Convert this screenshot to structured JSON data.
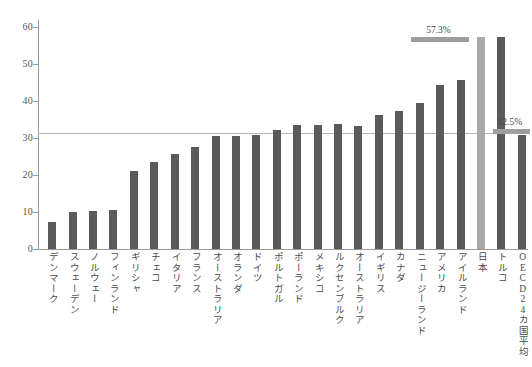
{
  "chart_data": {
    "type": "bar",
    "title": "",
    "xlabel": "",
    "ylabel": "",
    "ylim": [
      0,
      62
    ],
    "grid": false,
    "legend": "none",
    "y_ticks": [
      0,
      10,
      20,
      30,
      40,
      50,
      60
    ],
    "categories": [
      "デンマーク",
      "スウェーデン",
      "ノルウェー",
      "フィンランド",
      "ギリシャ",
      "チェコ",
      "イタリア",
      "フランス",
      "オーストラリア",
      "オランダ",
      "ドイツ",
      "ポルトガル",
      "ポーランド",
      "メキシコ",
      "ルクセンブルク",
      "オーストラリア",
      "イギリス",
      "カナダ",
      "ニュージーランド",
      "アメリカ",
      "アイルランド",
      "日本",
      "トルコ",
      "OECD24カ国平均"
    ],
    "values": [
      7.4,
      10.1,
      10.2,
      10.6,
      21.2,
      23.5,
      25.8,
      27.5,
      30.5,
      30.5,
      31.0,
      32.2,
      33.7,
      33.6,
      33.8,
      33.4,
      36.2,
      37.4,
      39.4,
      44.3,
      45.7,
      57.3,
      57.5,
      31.0
    ],
    "highlight_index": 21,
    "highlight_label": "日本",
    "reference_line_value": 31.4,
    "annotations": [
      {
        "label": "57.3%",
        "value": 57.3
      },
      {
        "label": "32.5%",
        "value": 32.5
      }
    ],
    "colors": {
      "bar": "#5a5a5a",
      "highlight_bar": "#a8a8a8",
      "annotation_bar": "#9e9e9e",
      "axis": "#9a9a9a",
      "reference_line": "#b5b5b5",
      "text": "#4a4a4a",
      "background": "#ffffff"
    }
  }
}
